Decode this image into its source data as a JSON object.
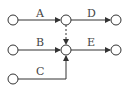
{
  "diagram": {
    "type": "activity-on-arrow network",
    "colors": {
      "stroke": "#333333",
      "label": "#444444",
      "background": "#ffffff"
    },
    "nodes": [
      {
        "id": "n1",
        "x": 13,
        "y": 20
      },
      {
        "id": "n2",
        "x": 13,
        "y": 50
      },
      {
        "id": "n3",
        "x": 13,
        "y": 79
      },
      {
        "id": "n4",
        "x": 66,
        "y": 20
      },
      {
        "id": "n5",
        "x": 66,
        "y": 50
      },
      {
        "id": "n6",
        "x": 116,
        "y": 20
      },
      {
        "id": "n7",
        "x": 116,
        "y": 50
      }
    ],
    "activities": [
      {
        "label": "A",
        "from": "n1",
        "to": "n4"
      },
      {
        "label": "B",
        "from": "n2",
        "to": "n5"
      },
      {
        "label": "C",
        "from": "n3",
        "to": "n5"
      },
      {
        "label": "D",
        "from": "n4",
        "to": "n6"
      },
      {
        "label": "E",
        "from": "n5",
        "to": "n7"
      }
    ],
    "dummy": [
      {
        "from": "n4",
        "to": "n5",
        "style": "dashed"
      }
    ]
  }
}
